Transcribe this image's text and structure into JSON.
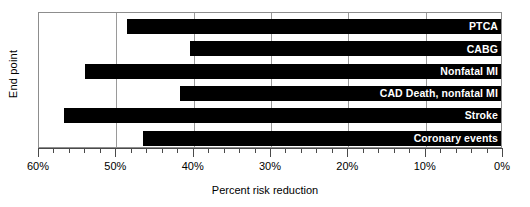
{
  "chart_data": {
    "type": "bar",
    "orientation": "horizontal",
    "title": "",
    "xlabel": "Percent risk reduction",
    "ylabel": "End point",
    "xlim": [
      60,
      0
    ],
    "x_reversed": true,
    "grid": true,
    "legend": null,
    "major_tick_step": 10,
    "minor_tick_step": 2,
    "categories": [
      "PTCA",
      "CABG",
      "Nonfatal MI",
      "CAD Death, nonfatal MI",
      "Stroke",
      "Coronary events"
    ],
    "values": [
      48.6,
      40.5,
      54.0,
      41.8,
      56.8,
      46.5
    ],
    "value_unit": "%",
    "x_tick_labels": [
      "60%",
      "50%",
      "40%",
      "30%",
      "20%",
      "10%",
      "0%"
    ],
    "x_tick_values": [
      60,
      50,
      40,
      30,
      20,
      10,
      0
    ],
    "bar_color": "#000000",
    "label_color": "#FFFFFF",
    "frame_color": "#8D8D8D",
    "background_color": "#FFFFFF"
  }
}
